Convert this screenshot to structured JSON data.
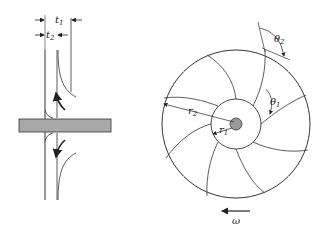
{
  "diagram": {
    "side_view": {
      "labels": {
        "t1": "t",
        "t1_sub": "1",
        "t2": "t",
        "t2_sub": "2"
      }
    },
    "front_view": {
      "labels": {
        "r1": "r",
        "r1_sub": "1",
        "r2": "r",
        "r2_sub": "2",
        "theta1": "θ",
        "theta1_sub": "1",
        "theta2": "θ",
        "theta2_sub": "2",
        "omega": "ω"
      },
      "vane_count": 8
    },
    "colors": {
      "line": "#333333",
      "shaft": "#a8a8a8",
      "hub": "#9a9a9a"
    }
  }
}
